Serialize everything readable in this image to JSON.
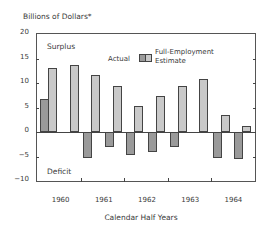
{
  "chart_data": {
    "type": "bar",
    "title": "",
    "ylabel": "Billions of Dollars*",
    "xlabel": "Calendar Half Years",
    "ylim": [
      -10,
      20
    ],
    "yticks": [
      "20",
      "15",
      "10",
      "5",
      "0",
      "−5",
      "−10"
    ],
    "year_labels": [
      "1960",
      "1961",
      "1962",
      "1963",
      "1964"
    ],
    "categories": [
      "1960 H1",
      "1960 H2",
      "1961 H1",
      "1961 H2",
      "1962 H1",
      "1962 H2",
      "1963 H1",
      "1963 H2",
      "1964 H1",
      "1964 H2"
    ],
    "series": [
      {
        "name": "Actual",
        "color": "#9a9a9a",
        "values": [
          6.8,
          0,
          -5.3,
          -3.0,
          -4.7,
          -4.0,
          -3.0,
          0,
          -5.4,
          -5.6
        ]
      },
      {
        "name": "Full-Employment Estimate",
        "color": "#c9c9c9",
        "values": [
          13.0,
          13.7,
          11.7,
          9.3,
          5.4,
          7.3,
          9.3,
          10.8,
          3.5,
          1.3
        ]
      }
    ],
    "annotations": [
      "Surplus",
      "Deficit"
    ],
    "legend": {
      "actual_label": "Actual",
      "fe_label_line1": "Full-Employment",
      "fe_label_line2": "Estimate"
    },
    "grid": false
  }
}
